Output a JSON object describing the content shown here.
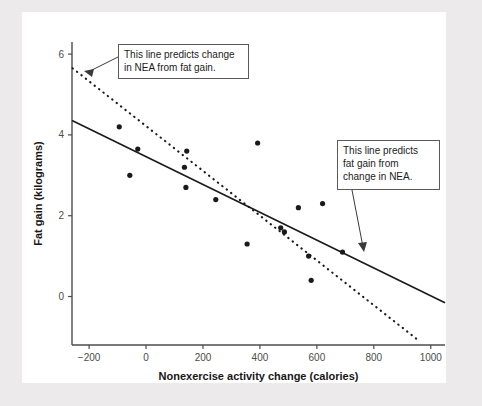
{
  "figure": {
    "background_color": "#eceaea",
    "plot_background_color": "#ffffff",
    "axis_color": "#4c4c4c",
    "point_color": "#1a1a1a",
    "line_color": "#1a1a1a"
  },
  "annotations": [
    {
      "id": "nea-from-fat-gain",
      "text": "This line predicts change\nin NEA from fat gain.",
      "target_line": "dashed"
    },
    {
      "id": "fat-gain-from-nea",
      "text": "This line predicts\nfat gain from\nchange in NEA.",
      "target_line": "solid"
    }
  ],
  "chart_data": {
    "type": "scatter",
    "title": "",
    "xlabel": "Nonexercise activity change (calories)",
    "ylabel": "Fat gain (kilograms)",
    "xlim": [
      -260,
      1050
    ],
    "ylim": [
      -1.2,
      6.3
    ],
    "xticks": [
      -200,
      0,
      200,
      400,
      600,
      800,
      1000
    ],
    "xtick_labels": [
      "−200",
      "0",
      "200",
      "400",
      "600",
      "800",
      "1000"
    ],
    "yticks": [
      0,
      2,
      4,
      6
    ],
    "ytick_labels": [
      "0",
      "2",
      "4",
      "6"
    ],
    "grid": false,
    "legend": "none",
    "points": [
      {
        "x": -94,
        "y": 4.2
      },
      {
        "x": -57,
        "y": 3.0
      },
      {
        "x": -29,
        "y": 3.65
      },
      {
        "x": 135,
        "y": 3.2
      },
      {
        "x": 143,
        "y": 3.6
      },
      {
        "x": 140,
        "y": 2.7
      },
      {
        "x": 245,
        "y": 2.4
      },
      {
        "x": 355,
        "y": 1.3
      },
      {
        "x": 392,
        "y": 3.8
      },
      {
        "x": 473,
        "y": 1.7
      },
      {
        "x": 486,
        "y": 1.6
      },
      {
        "x": 535,
        "y": 2.2
      },
      {
        "x": 571,
        "y": 1.0
      },
      {
        "x": 580,
        "y": 0.4
      },
      {
        "x": 620,
        "y": 2.3
      },
      {
        "x": 690,
        "y": 1.1
      }
    ],
    "series": [
      {
        "name": "fat gain on NEA (solid)",
        "style": "solid",
        "x_start": -258,
        "y_start": 4.35,
        "x_end": 1048,
        "y_end": -0.15
      },
      {
        "name": "NEA on fat gain (dashed)",
        "style": "dashed",
        "x_start": -258,
        "y_start": 5.65,
        "x_end": 963,
        "y_end": -1.12
      }
    ]
  }
}
